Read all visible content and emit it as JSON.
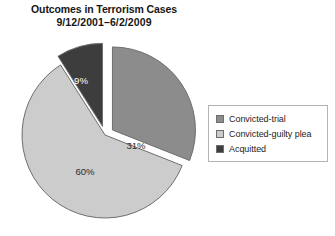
{
  "title": {
    "line1": "Outcomes in Terrorism Cases",
    "line2": "9/12/2001–6/2/2009"
  },
  "colors": {
    "convicted_trial": "#8c8c8c",
    "convicted_guilty_plea": "#cccccc",
    "acquitted": "#3d3d3d",
    "slice_outline": "#6e6e6e",
    "legend_border": "#b4b4b4",
    "background": "#ffffff",
    "text": "#1c1c1c",
    "label_light": "#ffffff"
  },
  "legend": {
    "items": [
      {
        "label": "Convicted-trial",
        "color": "#8c8c8c"
      },
      {
        "label": "Convicted-guilty plea",
        "color": "#cccccc"
      },
      {
        "label": "Acquitted",
        "color": "#3d3d3d"
      }
    ]
  },
  "pie": {
    "labels": {
      "convicted_trial": "31%",
      "convicted_guilty_plea": "60%",
      "acquitted": "9%"
    }
  },
  "chart_data": {
    "type": "pie",
    "title": "Outcomes in Terrorism Cases 9/12/2001–6/2/2009",
    "categories": [
      "Convicted-trial",
      "Convicted-guilty plea",
      "Acquitted"
    ],
    "values": [
      31,
      60,
      9
    ],
    "value_labels": [
      "31%",
      "60%",
      "9%"
    ],
    "units": "percent",
    "colors": [
      "#8c8c8c",
      "#cccccc",
      "#3d3d3d"
    ],
    "exploded": [
      true,
      false,
      true
    ],
    "legend_position": "right",
    "grid": false,
    "xlabel": "",
    "ylabel": ""
  }
}
